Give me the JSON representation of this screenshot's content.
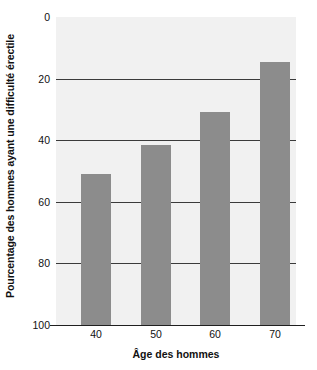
{
  "chart_data": {
    "type": "bar",
    "title": "",
    "subtitle": "",
    "xlabel": "Âge des hommes",
    "ylabel": "Pourcentage des hommes ayant une difficulté érectile",
    "categories": [
      "40",
      "50",
      "60",
      "70"
    ],
    "values": [
      49,
      58.5,
      69,
      85.5
    ],
    "series": [
      {
        "name": "Pourcentage des hommes ayant une difficulté érectile",
        "values": [
          49,
          58.5,
          69,
          85.5
        ]
      }
    ],
    "ylim": [
      0,
      100
    ],
    "ytick_labels": [
      "0",
      "20",
      "40",
      "60",
      "80",
      "100"
    ],
    "ytick_values": [
      0,
      20,
      40,
      60,
      80,
      100
    ],
    "xtick_labels": [
      "40",
      "50",
      "60",
      "70"
    ],
    "grid": "horizontal",
    "legend": "none",
    "annotations": [],
    "colors": {
      "bar_fill": "#8c8c8c",
      "plot_background": "#f1f1f1",
      "gridline": "#3b3b3b",
      "axis_line": "#1f1f1f",
      "text": "#111111",
      "figure_background": "#ffffff"
    }
  }
}
